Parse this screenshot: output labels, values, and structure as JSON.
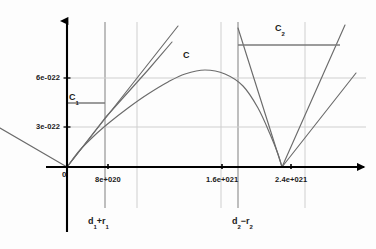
{
  "figure": {
    "type": "diagram",
    "background_color": "#fdfdfd",
    "axis_color": "#000000",
    "curve_color": "#6b6b6b",
    "gridline_color": "#c9c9c9",
    "level_line_color": "#7a7a7a"
  },
  "axes": {
    "origin_label": "0",
    "y_ticks": [
      {
        "label": "6e-022",
        "value": 6e-22,
        "y_px": 78
      },
      {
        "label": "3e-022",
        "value": 3e-22,
        "y_px": 127
      }
    ],
    "x_ticks": [
      {
        "label": "8e+020",
        "value": 8e+20,
        "x_px": 108
      },
      {
        "label": "1.6e+021",
        "value": 1.6e+21,
        "x_px": 222
      },
      {
        "label": "2.4e+021",
        "value": 2.4e+21,
        "x_px": 291
      }
    ],
    "x_axis_y_px": 167,
    "y_axis_x_px": 67,
    "has_x_arrow": true,
    "has_y_arrow": true
  },
  "annotations": [
    {
      "name": "curve-c-label",
      "text": "C",
      "sub": "",
      "x_px": 183,
      "y_px": 50
    },
    {
      "name": "level-c1-label",
      "text": "C",
      "sub": "1",
      "x_px": 69,
      "y_px": 92
    },
    {
      "name": "level-c2-label",
      "text": "C",
      "sub": "2",
      "x_px": 275,
      "y_px": 23
    }
  ],
  "x_markers": [
    {
      "name": "marker-d1-plus-r1",
      "text": "d",
      "sub1": "1",
      "op": "+",
      "text2": "r",
      "sub2": "1",
      "x_px": 105,
      "label_x_px": 88,
      "label_y_px": 216
    },
    {
      "name": "marker-d2-minus-r2",
      "text": "d",
      "sub1": "2",
      "op": "−",
      "text2": "r",
      "sub2": "2",
      "x_px": 238,
      "label_x_px": 232,
      "label_y_px": 216
    }
  ],
  "chart_data": {
    "type": "line",
    "title": "",
    "xlabel": "",
    "ylabel": "",
    "xlim": [
      0,
      2.9e+21
    ],
    "ylim": [
      0,
      1.05e-21
    ],
    "grid": true,
    "legend": "none",
    "series": [
      {
        "name": "C",
        "role": "main-arc",
        "points_px": [
          [
            67,
            167
          ],
          [
            80,
            150
          ],
          [
            95,
            135
          ],
          [
            110,
            122
          ],
          [
            128,
            108
          ],
          [
            148,
            94
          ],
          [
            168,
            82
          ],
          [
            185,
            74
          ],
          [
            205,
            70
          ],
          [
            225,
            74
          ],
          [
            243,
            86
          ],
          [
            258,
            108
          ],
          [
            270,
            134
          ],
          [
            278,
            154
          ],
          [
            282,
            167
          ]
        ]
      },
      {
        "name": "tangent-steep",
        "role": "straight-line",
        "points_px": [
          [
            67,
            167
          ],
          [
            178,
            26
          ]
        ]
      },
      {
        "name": "tangent-shallow",
        "role": "straight-line",
        "points_px": [
          [
            67,
            167
          ],
          [
            105,
            118
          ],
          [
            148,
            70
          ],
          [
            172,
            42
          ]
        ]
      },
      {
        "name": "left-tail",
        "role": "straight-line",
        "points_px": [
          [
            0,
            128
          ],
          [
            67,
            167
          ]
        ]
      },
      {
        "name": "cone-left-edge",
        "role": "straight-line",
        "points_px": [
          [
            238,
            28
          ],
          [
            282,
            167
          ]
        ]
      },
      {
        "name": "cone-right-edge",
        "role": "straight-line",
        "points_px": [
          [
            282,
            167
          ],
          [
            345,
            25
          ]
        ]
      },
      {
        "name": "cone-right-inner",
        "role": "straight-line",
        "points_px": [
          [
            282,
            167
          ],
          [
            356,
            73
          ]
        ]
      }
    ],
    "level_lines": [
      {
        "name": "C1",
        "y_px": 103,
        "x_from_px": 67,
        "x_to_px": 105
      },
      {
        "name": "C2",
        "y_px": 45,
        "x_from_px": 238,
        "x_to_px": 340
      }
    ],
    "vertical_gridlines_px": [
      {
        "x_px": 105,
        "weight": "dark"
      },
      {
        "x_px": 137,
        "weight": "light"
      },
      {
        "x_px": 221,
        "weight": "light"
      },
      {
        "x_px": 238,
        "weight": "dark"
      },
      {
        "x_px": 305,
        "weight": "light"
      }
    ],
    "horizontal_gridlines_px": [
      {
        "y_px": 78
      },
      {
        "y_px": 127
      }
    ]
  }
}
